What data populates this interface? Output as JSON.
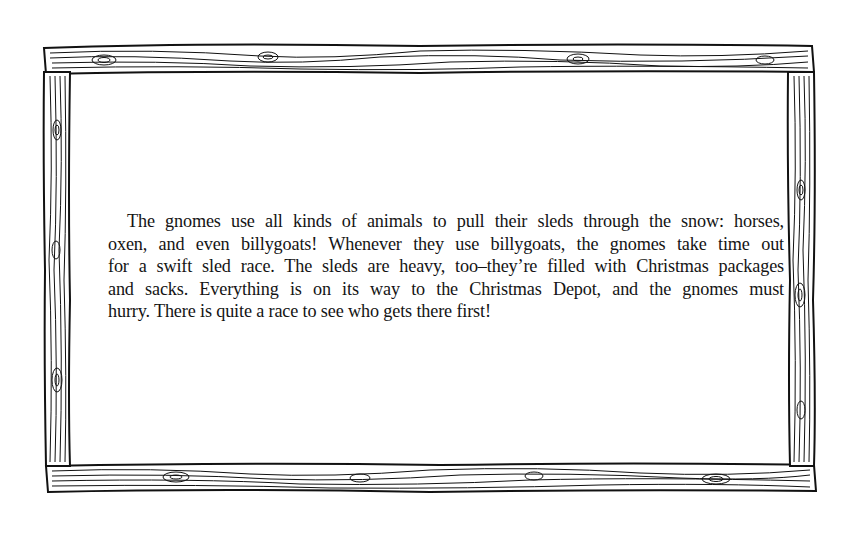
{
  "page": {
    "frame": {
      "style": "hand-drawn wooden plank border",
      "stroke_color": "#111111",
      "fill_color": "#ffffff"
    },
    "paragraph": {
      "full_text": "The gnomes use all kinds of animals to pull their sleds through the snow: horses, oxen, and even billygoats! Whenever they use billygoats, the gnomes take time out for a swift sled race. The sleds are heavy, too–they’re filled with Christmas packages and sacks. Everything is on its way to the Christmas Depot, and the gnomes must hurry. There is quite a race to see who gets there first!",
      "lines": [
        "The gnomes use all kinds of animals to pull their sleds through the snow: horses,",
        "oxen, and even billygoats! Whenever they use billygoats, the gnomes take time out",
        "for a swift sled race. The sleds are heavy, too–they’re filled with Christmas packages",
        "and sacks. Everything is on its way to the Christmas Depot, and the gnomes must",
        "hurry. There is quite a race to see who gets there first!"
      ]
    }
  }
}
